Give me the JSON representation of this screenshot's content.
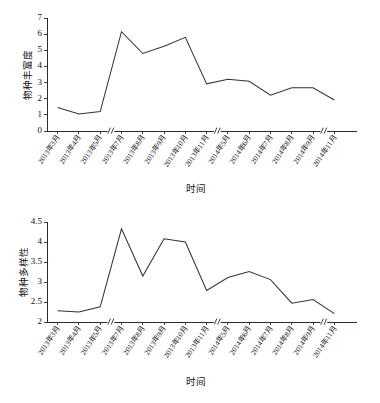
{
  "chart_data": [
    {
      "type": "line",
      "id": "species-richness",
      "title": "",
      "xlabel": "时间",
      "ylabel": "物种丰富度",
      "categories": [
        "2013年3月",
        "2013年4月",
        "2013年5月",
        "2013年7月",
        "2013年8月",
        "2013年9月",
        "2013年10月",
        "2013年11月",
        "2014年5月",
        "2014年6月",
        "2014年7月",
        "2014年8月",
        "2014年9月",
        "2014年11月"
      ],
      "values": [
        1.45,
        1.05,
        1.2,
        6.15,
        4.8,
        5.25,
        5.8,
        2.92,
        3.2,
        3.08,
        2.22,
        2.68,
        2.68,
        1.92
      ],
      "yticks": [
        "0",
        "1",
        "2",
        "3",
        "4",
        "5",
        "6",
        "7"
      ],
      "ylim": [
        0,
        7
      ],
      "grid": false,
      "legend": "none",
      "axis_breaks_after": [
        "2013年5月",
        "2013年11月",
        "2014年9月"
      ]
    },
    {
      "type": "line",
      "id": "species-diversity",
      "title": "",
      "xlabel": "时间",
      "ylabel": "物种多样性",
      "categories": [
        "2013年3月",
        "2013年4月",
        "2013年5月",
        "2013年7月",
        "2013年8月",
        "2013年9月",
        "2013年10月",
        "2013年11月",
        "2014年5月",
        "2014年6月",
        "2014年7月",
        "2014年8月",
        "2014年9月",
        "2014年11月"
      ],
      "values": [
        2.28,
        2.25,
        2.38,
        4.33,
        3.15,
        4.08,
        4.0,
        2.79,
        3.11,
        3.26,
        3.06,
        2.47,
        2.56,
        2.21
      ],
      "yticks": [
        "2",
        "2.5",
        "3",
        "3.5",
        "4",
        "4.5"
      ],
      "ylim": [
        2,
        4.5
      ],
      "grid": false,
      "legend": "none",
      "axis_breaks_after": [
        "2013年5月",
        "2013年11月",
        "2014年9月"
      ]
    }
  ]
}
